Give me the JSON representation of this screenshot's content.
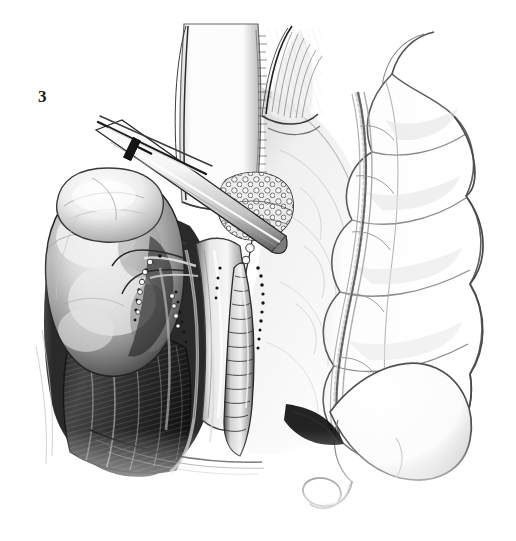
{
  "figure": {
    "label": "3",
    "caption_text": "",
    "medium": "grayscale pen-and-ink wash medical illustration",
    "background_color": "#ffffff",
    "ink_color": "#1a1a1a",
    "width_px": 516,
    "height_px": 541
  },
  "palette": {
    "paper": "#ffffff",
    "ink_dark": "#141414",
    "ink_mid": "#6e6e6e",
    "ink_light": "#b9b9b9",
    "wash_pale": "#e4e4e4",
    "wash_faint": "#f2f2f2",
    "shadow_deep": "#0c0c0c",
    "highlight": "#fdfdfd"
  },
  "scene": {
    "title": "Right retroperitoneal surgical exposure",
    "view": "anterior oblique operative field",
    "regions": [
      {
        "name": "kidney",
        "label": "kidney",
        "description": "large rounded organ, left of field, pale wash with mottled cortex",
        "cx": 112,
        "cy": 272,
        "rx": 68,
        "ry": 96,
        "tone": "#cfcfcf"
      },
      {
        "name": "adrenal-gland",
        "label": "adrenal gland",
        "description": "pale cap resting over upper kidney pole",
        "cx": 108,
        "cy": 205,
        "rx": 52,
        "ry": 36,
        "tone": "#e8e8e8"
      },
      {
        "name": "retracted-duodenum",
        "label": "retracted duodenum",
        "description": "broad white vertical band rising from field centre to top edge",
        "x": 176,
        "y": 24,
        "w": 86,
        "h": 182,
        "tone": "#fbfbfb"
      },
      {
        "name": "mesenteric-fan",
        "label": "mesenteric fan",
        "description": "feathered striated fan of fine vessels at upper centre",
        "cx": 285,
        "cy": 70,
        "tone": "#9a9a9a"
      },
      {
        "name": "lymph-node-cluster",
        "label": "lymph node cluster",
        "description": "cobblestone cluster of nodes beside the great vessels",
        "cx": 252,
        "cy": 205,
        "rx": 34,
        "ry": 30,
        "tone": "#dadada"
      },
      {
        "name": "ureter",
        "label": "ureter",
        "description": "segmented tubular structure descending through centre of field",
        "x": 238,
        "y": 262,
        "w": 30,
        "h": 160,
        "tone": "#d6d6d6"
      },
      {
        "name": "great-vessels",
        "label": "aorta and inferior vena cava",
        "description": "pale longitudinal vascular trunks behind the ureter",
        "x": 196,
        "y": 240,
        "w": 40,
        "h": 200,
        "tone": "#c4c4c4"
      },
      {
        "name": "psoas-muscle",
        "label": "psoas muscle bed",
        "description": "dark striated muscle floor of the dissection in lower left",
        "x": 64,
        "y": 330,
        "w": 130,
        "h": 140,
        "tone": "#3a3a3a"
      },
      {
        "name": "ascending-colon",
        "label": "ascending colon",
        "description": "haustrated bowel running down the right side of the field",
        "x": 322,
        "y": 70,
        "w": 178,
        "h": 350,
        "tone": "#fafafa"
      },
      {
        "name": "marginal-artery",
        "label": "marginal artery",
        "description": "stippled vascular arcade hugging the mesenteric border of the colon",
        "tone": "#707070"
      },
      {
        "name": "cecum",
        "label": "cecum",
        "description": "rounded bowel pouch at lower right of field",
        "cx": 398,
        "cy": 450,
        "rx": 72,
        "ry": 58,
        "tone": "#fcfcfc"
      },
      {
        "name": "appendix",
        "label": "appendix",
        "description": "slender hooked tube looping below the cecum",
        "cx": 350,
        "cy": 500,
        "tone": "#8a8a8a"
      },
      {
        "name": "peritoneal-reflection",
        "label": "peritoneal reflection",
        "description": "thin pale membrane sheet sweeping from upper centre to lower right",
        "tone": "#ededed"
      }
    ],
    "instruments": [
      {
        "name": "retractor-blade",
        "label": "retractor blade",
        "description": "long flat malleable blade entering from upper left at a diagonal, holding tissue aside",
        "x1": 92,
        "y1": 128,
        "x2": 278,
        "y2": 228,
        "tone": "#f6f6f6"
      },
      {
        "name": "forceps-tip",
        "label": "forceps tip",
        "description": "fine paired instrument shafts above the retractor blade",
        "x1": 98,
        "y1": 122,
        "x2": 200,
        "y2": 170,
        "tone": "#2a2a2a"
      }
    ],
    "markers": [
      {
        "name": "ligature-clips",
        "label": "ligature clips",
        "description": "small dark beads marking ligated lymphatics along the vessels",
        "count": 28
      },
      {
        "name": "suture-stipple",
        "label": "suture stipple",
        "description": "dotted stitch line along the dissected ureteric sheath",
        "count": 16
      }
    ]
  }
}
